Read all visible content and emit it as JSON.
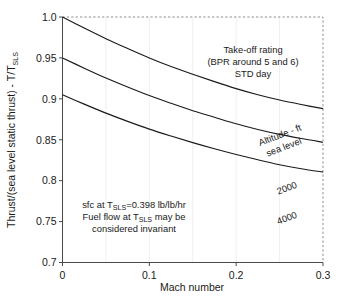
{
  "chart_data": {
    "type": "line",
    "title": "",
    "xlabel": "Mach number",
    "ylabel": "Thrust/(sea level static thrust) - T/T",
    "ylabel_sub": "SLS",
    "xlim": [
      0,
      0.3
    ],
    "ylim": [
      0.7,
      1.0
    ],
    "grid": true,
    "grid_axis": "x",
    "legend_position": "none",
    "xticks": [
      0,
      0.1,
      0.2,
      0.3
    ],
    "xtick_labels": [
      "0",
      "0.1",
      "0.2",
      "0.3"
    ],
    "yticks": [
      0.7,
      0.75,
      0.8,
      0.85,
      0.9,
      0.95,
      1.0
    ],
    "ytick_labels": [
      "0.7",
      "0.75",
      "0.8",
      "0.85",
      "0.9",
      "0.95",
      "1.0"
    ],
    "x": [
      0,
      0.025,
      0.05,
      0.075,
      0.1,
      0.125,
      0.15,
      0.175,
      0.2,
      0.225,
      0.25,
      0.275,
      0.3
    ],
    "series": [
      {
        "name": "sea level",
        "label": "Altitude - ft",
        "label_line2": "sea level",
        "values": [
          1.0,
          0.9865,
          0.9735,
          0.9615,
          0.95,
          0.9395,
          0.93,
          0.921,
          0.9125,
          0.905,
          0.8985,
          0.893,
          0.888
        ]
      },
      {
        "name": "2000",
        "label": "2000",
        "values": [
          0.95,
          0.9375,
          0.9255,
          0.9145,
          0.904,
          0.8945,
          0.8855,
          0.8775,
          0.8695,
          0.8625,
          0.8565,
          0.8515,
          0.847
        ]
      },
      {
        "name": "4000",
        "label": "4000",
        "values": [
          0.905,
          0.8935,
          0.8825,
          0.8725,
          0.863,
          0.8545,
          0.8465,
          0.839,
          0.832,
          0.8255,
          0.8195,
          0.8145,
          0.8105
        ]
      }
    ],
    "annotations": [
      {
        "name": "rating-note",
        "lines": [
          "Take-off rating",
          "(BPR around 5 and 6)",
          "STD day"
        ],
        "x": 0.175,
        "y": 0.955
      },
      {
        "name": "sfc-note",
        "lines": [
          "sfc at T",
          "=0.398 lb/lb/hr",
          "Fuel flow at T",
          " may be",
          "considered invariant"
        ],
        "line1_prefix": "sfc at T",
        "line1_sub": "SLS",
        "line1_suffix": "=0.398 lb/lb/hr",
        "line2_prefix": "Fuel flow at T",
        "line2_sub": "SLS",
        "line2_suffix": " may be",
        "line3": "considered invariant",
        "x": 0.05,
        "y": 0.775
      }
    ],
    "colors": {
      "curve": "#1a1a1a",
      "axis": "#4a4a4a",
      "dashed_axis": "#8a8a8a",
      "grid": "#efefef",
      "background": "#ffffff",
      "text": "#1a1a1a"
    }
  }
}
